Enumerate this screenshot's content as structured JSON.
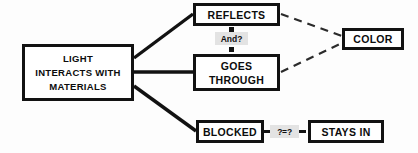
{
  "diagram": {
    "type": "concept-map",
    "background_color": "#fdfdfd",
    "stroke_color": "#121212",
    "label_background_color": "#e3e3e3",
    "nodes": [
      {
        "id": "main",
        "lines": [
          "LIGHT",
          "INTERACTS WITH",
          "MATERIALS"
        ]
      },
      {
        "id": "reflects",
        "lines": [
          "REFLECTS"
        ]
      },
      {
        "id": "goes_through",
        "lines": [
          "GOES",
          "THROUGH"
        ]
      },
      {
        "id": "blocked",
        "lines": [
          "BLOCKED"
        ]
      },
      {
        "id": "stays_in",
        "lines": [
          "STAYS IN"
        ]
      },
      {
        "id": "color",
        "lines": [
          "COLOR"
        ]
      }
    ],
    "edge_labels": [
      {
        "id": "and",
        "text": "And?"
      },
      {
        "id": "equals",
        "text": "?=?"
      }
    ],
    "edges": [
      {
        "from": "main",
        "to": "reflects",
        "style": "solid"
      },
      {
        "from": "main",
        "to": "goes_through",
        "style": "solid"
      },
      {
        "from": "main",
        "to": "blocked",
        "style": "solid"
      },
      {
        "from": "reflects",
        "to": "color",
        "style": "dashed"
      },
      {
        "from": "goes_through",
        "to": "color",
        "style": "dashed"
      },
      {
        "from": "blocked",
        "to": "stays_in",
        "style": "dotted-segments"
      }
    ]
  }
}
